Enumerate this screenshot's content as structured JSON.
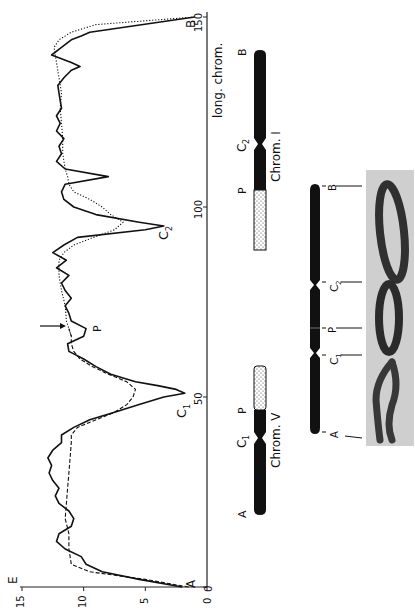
{
  "figure": {
    "orientation": "rotated-90-ccw",
    "panels": [
      "densitometer-profile",
      "chromosome-ideograms",
      "micrograph"
    ]
  },
  "chart_data": {
    "type": "line",
    "title": "",
    "xlabel": "long. chrom.",
    "ylabel": "E",
    "xlim": [
      0,
      150
    ],
    "ylim": [
      0,
      15
    ],
    "x_ticks": [
      0,
      50,
      100,
      150
    ],
    "y_ticks": [
      0,
      5,
      10,
      15
    ],
    "x_tick_labels": [
      "0",
      "50",
      "100",
      "150"
    ],
    "y_tick_labels": [
      "0",
      "5",
      "10",
      "15"
    ],
    "series": [
      {
        "name": "long chromosome (solid)",
        "style": "solid",
        "points": [
          [
            0,
            2.0
          ],
          [
            2,
            5.5
          ],
          [
            4,
            8.5
          ],
          [
            6,
            9.8
          ],
          [
            8,
            10.2
          ],
          [
            10,
            11.5
          ],
          [
            12,
            12.2
          ],
          [
            14,
            12.0
          ],
          [
            16,
            11.0
          ],
          [
            18,
            10.8
          ],
          [
            20,
            11.2
          ],
          [
            22,
            12.0
          ],
          [
            24,
            12.3
          ],
          [
            26,
            12.0
          ],
          [
            28,
            12.5
          ],
          [
            30,
            12.8
          ],
          [
            32,
            12.6
          ],
          [
            34,
            12.9
          ],
          [
            36,
            12.5
          ],
          [
            38,
            11.8
          ],
          [
            40,
            11.8
          ],
          [
            42,
            10.8
          ],
          [
            44,
            9.5
          ],
          [
            46,
            7.5
          ],
          [
            48,
            5.5
          ],
          [
            50,
            3.5
          ],
          [
            51,
            1.8
          ],
          [
            52,
            2.5
          ],
          [
            53,
            4.0
          ],
          [
            54,
            5.8
          ],
          [
            56,
            7.8
          ],
          [
            58,
            9.0
          ],
          [
            60,
            10.0
          ],
          [
            62,
            11.2
          ],
          [
            64,
            11.3
          ],
          [
            66,
            10.0
          ],
          [
            68,
            9.8
          ],
          [
            70,
            11.0
          ],
          [
            72,
            11.2
          ],
          [
            74,
            11.5
          ],
          [
            76,
            11.0
          ],
          [
            78,
            11.5
          ],
          [
            80,
            11.8
          ],
          [
            82,
            11.2
          ],
          [
            84,
            12.2
          ],
          [
            86,
            11.4
          ],
          [
            88,
            12.5
          ],
          [
            90,
            11.6
          ],
          [
            92,
            10.5
          ],
          [
            94,
            5.0
          ],
          [
            95,
            3.5
          ],
          [
            96,
            5.5
          ],
          [
            98,
            9.0
          ],
          [
            100,
            10.8
          ],
          [
            102,
            11.6
          ],
          [
            104,
            11.8
          ],
          [
            106,
            11.5
          ],
          [
            108,
            8.0
          ],
          [
            110,
            11.5
          ],
          [
            112,
            12.2
          ],
          [
            114,
            11.8
          ],
          [
            116,
            12.0
          ],
          [
            118,
            11.6
          ],
          [
            120,
            12.2
          ],
          [
            122,
            11.9
          ],
          [
            124,
            12.2
          ],
          [
            126,
            11.8
          ],
          [
            128,
            11.9
          ],
          [
            130,
            12.0
          ],
          [
            132,
            12.1
          ],
          [
            134,
            11.6
          ],
          [
            136,
            11.0
          ],
          [
            137,
            10.3
          ],
          [
            138,
            11.0
          ],
          [
            140,
            12.6
          ],
          [
            142,
            11.8
          ],
          [
            144,
            11.0
          ],
          [
            145,
            10.2
          ],
          [
            146,
            9.5
          ],
          [
            150,
            1.0
          ]
        ]
      },
      {
        "name": "chrom. V (dashed)",
        "style": "dashed",
        "points": [
          [
            0,
            1.5
          ],
          [
            2,
            5.0
          ],
          [
            4,
            9.5
          ],
          [
            6,
            11.0
          ],
          [
            10,
            11.2
          ],
          [
            14,
            11.2
          ],
          [
            18,
            11.5
          ],
          [
            22,
            11.4
          ],
          [
            26,
            11.3
          ],
          [
            30,
            11.2
          ],
          [
            34,
            11.1
          ],
          [
            38,
            11.0
          ],
          [
            40,
            11.0
          ],
          [
            42,
            10.5
          ],
          [
            44,
            9.0
          ],
          [
            46,
            7.5
          ],
          [
            48,
            6.5
          ],
          [
            50,
            6.0
          ],
          [
            52,
            5.8
          ],
          [
            54,
            6.5
          ],
          [
            56,
            8.0
          ],
          [
            58,
            9.3
          ],
          [
            60,
            10.3
          ],
          [
            62,
            10.8
          ],
          [
            64,
            11.0
          ],
          [
            66,
            11.0
          ],
          [
            68,
            11.2
          ]
        ]
      },
      {
        "name": "chrom. I (dotted)",
        "style": "dotted",
        "points": [
          [
            66,
            11.0
          ],
          [
            70,
            11.4
          ],
          [
            74,
            11.5
          ],
          [
            78,
            11.8
          ],
          [
            82,
            12.0
          ],
          [
            86,
            12.0
          ],
          [
            88,
            11.6
          ],
          [
            90,
            10.8
          ],
          [
            92,
            9.2
          ],
          [
            94,
            7.5
          ],
          [
            96,
            6.8
          ],
          [
            98,
            7.8
          ],
          [
            100,
            8.5
          ],
          [
            102,
            9.5
          ],
          [
            104,
            10.8
          ],
          [
            106,
            11.2
          ],
          [
            108,
            11.3
          ],
          [
            110,
            11.5
          ],
          [
            114,
            11.7
          ],
          [
            118,
            11.7
          ],
          [
            122,
            11.8
          ],
          [
            126,
            11.9
          ],
          [
            130,
            11.8
          ],
          [
            134,
            12.0
          ],
          [
            138,
            12.2
          ],
          [
            142,
            12.4
          ],
          [
            144,
            12.0
          ],
          [
            146,
            11.0
          ],
          [
            148,
            9.0
          ],
          [
            150,
            1.0
          ]
        ]
      }
    ],
    "annotations": [
      {
        "text": "A",
        "x": 1,
        "y": 2.5
      },
      {
        "text": "C1",
        "x": 52,
        "y": 0.7
      },
      {
        "text": "P",
        "x": 69,
        "y": 9.0
      },
      {
        "text": "C2",
        "x": 95,
        "y": 2.2
      },
      {
        "text": "B",
        "x": 148,
        "y": 0.3
      }
    ],
    "arrow": {
      "at_x": 69,
      "label": "P"
    }
  },
  "labels": {
    "x_axis": "long. chrom.",
    "y_axis": "E",
    "tick_0": "0",
    "tick_50": "50",
    "tick_100": "100",
    "tick_150": "150",
    "ytick_0": "0",
    "ytick_5": "5",
    "ytick_10": "10",
    "ytick_15": "15",
    "curve_A": "A",
    "curve_C1": "C",
    "curve_C1_sub": "1",
    "curve_P": "P",
    "curve_C2": "C",
    "curve_C2_sub": "2",
    "curve_B": "B"
  },
  "ideograms": {
    "chrom_v": {
      "name": "Chrom. V",
      "labels": {
        "A": "A",
        "C1": "C",
        "C1_sub": "1",
        "P": "P"
      }
    },
    "chrom_i": {
      "name": "Chrom. I",
      "labels": {
        "P": "P",
        "C2": "C",
        "C2_sub": "2",
        "B": "B"
      }
    },
    "long_chrom": {
      "labels": {
        "A": "A",
        "C1": "C",
        "C1_sub": "1",
        "P": "P",
        "C2": "C",
        "C2_sub": "2",
        "B": "B"
      }
    }
  }
}
